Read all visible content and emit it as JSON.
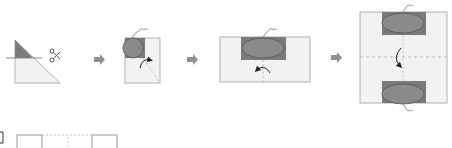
{
  "diagram": {
    "colors": {
      "paper": "#f2f2f2",
      "paper_edge": "#a8a8a8",
      "shaded": "#7a7a7a",
      "oval": "#8a8a8a",
      "oval_edge": "#555555",
      "arrow": "#909090",
      "dash": "#b8b8b8",
      "curl_arrow": "#222222"
    },
    "steps": [
      {
        "id": "step-1",
        "description": "Triangle folded with shaded tip cut by scissors",
        "icons": [
          "scissors-icon"
        ]
      },
      {
        "id": "step-2",
        "description": "Square with shaded corner and oval, fold arrow",
        "icons": [
          "curl-arrow-icon",
          "thread-icon"
        ]
      },
      {
        "id": "step-3",
        "description": "Rectangle with oval on top and fold arrow",
        "icons": [
          "curl-arrow-icon",
          "thread-icon"
        ]
      },
      {
        "id": "step-4",
        "description": "Unfolded square with two ovals top and bottom and dashed fold lines",
        "icons": [
          "curl-arrow-icon",
          "thread-icon"
        ]
      }
    ],
    "arrows_count": 3,
    "bottom_row": {
      "label": "]",
      "description": "Answer option squares partially visible"
    }
  }
}
